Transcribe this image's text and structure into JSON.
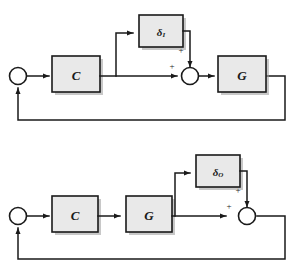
{
  "figure": {
    "title": "",
    "diagrams": [
      {
        "id": "input-disturbance-loop",
        "name": "input-disturbance-block-diagram",
        "blocks": [
          {
            "id": "controller",
            "label": "C",
            "subscript": ""
          },
          {
            "id": "plant",
            "label": "G",
            "subscript": ""
          },
          {
            "id": "disturbance",
            "label": "δ",
            "subscript": "I"
          }
        ],
        "junctions": [
          {
            "id": "error-sum",
            "label": ""
          },
          {
            "id": "disturbance-sum",
            "signs": [
              "+",
              "+"
            ]
          }
        ],
        "signs": {
          "from_controller": "+",
          "from_disturbance": "+"
        }
      },
      {
        "id": "output-disturbance-loop",
        "name": "output-disturbance-block-diagram",
        "blocks": [
          {
            "id": "controller",
            "label": "C",
            "subscript": ""
          },
          {
            "id": "plant",
            "label": "G",
            "subscript": ""
          },
          {
            "id": "disturbance",
            "label": "δ",
            "subscript": "O"
          }
        ],
        "junctions": [
          {
            "id": "error-sum",
            "label": ""
          },
          {
            "id": "disturbance-sum",
            "signs": [
              "+",
              "+"
            ]
          }
        ],
        "signs": {
          "from_plant": "+",
          "from_disturbance": "+"
        }
      }
    ],
    "colors": {
      "block_fill": "#e9e9e9",
      "line": "#1a1a1a",
      "background": "#ffffff",
      "shadow": "#9a9a9a"
    }
  }
}
